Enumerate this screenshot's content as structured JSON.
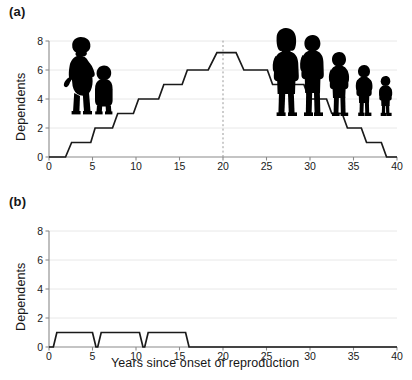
{
  "figure": {
    "background": "#ffffff",
    "line_color": "#1a1a1a",
    "grid_color": "#e8e8e8",
    "axis_color": "#8a8a8a",
    "marker_color": "#999999"
  },
  "panels": [
    {
      "id": "a",
      "label": "(a)",
      "ylabel": "Dependents",
      "xlabel": "",
      "silhouettes": [
        {
          "name": "pregnant-woman-with-toddler-silhouette"
        },
        {
          "name": "human-family-group-silhouette"
        }
      ]
    },
    {
      "id": "b",
      "label": "(b)",
      "ylabel": "Dependents",
      "xlabel": "Years since onset of reproduction",
      "silhouettes": [
        {
          "name": "chimpanzee-mother-silhouette"
        },
        {
          "name": "chimpanzee-infant-silhouette"
        }
      ]
    }
  ],
  "chart_data": [
    {
      "type": "line",
      "id": "human-dependents",
      "panel": "(a)",
      "title": "",
      "xlabel": "",
      "ylabel": "Dependents",
      "xlim": [
        0,
        40
      ],
      "ylim": [
        0,
        8
      ],
      "xticks": [
        0,
        5,
        10,
        15,
        20,
        25,
        30,
        35,
        40
      ],
      "yticks": [
        0,
        2,
        4,
        6,
        8
      ],
      "grid": "horizontal",
      "legend": "none",
      "annotations": [
        {
          "type": "vertical-dashed-line",
          "x": 20,
          "label": ""
        }
      ],
      "series": [
        {
          "name": "Human dependents",
          "style": "step-with-ramps",
          "points": [
            {
              "x": 0.0,
              "y": 0
            },
            {
              "x": 1.9,
              "y": 0
            },
            {
              "x": 2.6,
              "y": 1
            },
            {
              "x": 4.8,
              "y": 1
            },
            {
              "x": 5.3,
              "y": 2
            },
            {
              "x": 7.3,
              "y": 2
            },
            {
              "x": 7.9,
              "y": 3
            },
            {
              "x": 9.7,
              "y": 3
            },
            {
              "x": 10.3,
              "y": 4
            },
            {
              "x": 12.6,
              "y": 4
            },
            {
              "x": 13.2,
              "y": 5
            },
            {
              "x": 15.3,
              "y": 5
            },
            {
              "x": 15.9,
              "y": 6
            },
            {
              "x": 18.3,
              "y": 6
            },
            {
              "x": 19.3,
              "y": 7.2
            },
            {
              "x": 21.5,
              "y": 7.2
            },
            {
              "x": 22.4,
              "y": 6
            },
            {
              "x": 25.1,
              "y": 6
            },
            {
              "x": 25.7,
              "y": 5
            },
            {
              "x": 29.3,
              "y": 5
            },
            {
              "x": 29.9,
              "y": 4
            },
            {
              "x": 31.9,
              "y": 4
            },
            {
              "x": 32.5,
              "y": 3
            },
            {
              "x": 33.7,
              "y": 3
            },
            {
              "x": 34.3,
              "y": 2
            },
            {
              "x": 35.9,
              "y": 2
            },
            {
              "x": 36.5,
              "y": 1
            },
            {
              "x": 38.2,
              "y": 1
            },
            {
              "x": 38.8,
              "y": 0
            },
            {
              "x": 40.0,
              "y": 0
            }
          ]
        }
      ]
    },
    {
      "type": "line",
      "id": "chimpanzee-dependents",
      "panel": "(b)",
      "title": "",
      "xlabel": "Years since onset of reproduction",
      "ylabel": "Dependents",
      "xlim": [
        0,
        40
      ],
      "ylim": [
        0,
        8
      ],
      "xticks": [
        0,
        5,
        10,
        15,
        20,
        25,
        30,
        35,
        40
      ],
      "yticks": [
        0,
        2,
        4,
        6,
        8
      ],
      "grid": "horizontal",
      "legend": "none",
      "annotations": [],
      "series": [
        {
          "name": "Chimpanzee dependents",
          "style": "step-with-ramps",
          "points": [
            {
              "x": 0.0,
              "y": 0
            },
            {
              "x": 0.5,
              "y": 0
            },
            {
              "x": 0.9,
              "y": 1
            },
            {
              "x": 5.0,
              "y": 1
            },
            {
              "x": 5.4,
              "y": 0
            },
            {
              "x": 5.6,
              "y": 0
            },
            {
              "x": 6.0,
              "y": 1
            },
            {
              "x": 10.4,
              "y": 1
            },
            {
              "x": 10.8,
              "y": 0
            },
            {
              "x": 11.0,
              "y": 0
            },
            {
              "x": 11.4,
              "y": 1
            },
            {
              "x": 15.7,
              "y": 1
            },
            {
              "x": 16.1,
              "y": 0
            },
            {
              "x": 40.0,
              "y": 0
            }
          ]
        }
      ]
    }
  ]
}
